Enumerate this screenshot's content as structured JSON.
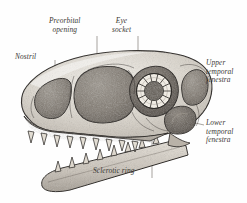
{
  "figure": {
    "style": "stippled engraving",
    "background_color": "#fefefe",
    "ink_color": "#2e2b28",
    "label_color": "#3a3733"
  },
  "labels": {
    "preorbital": "Preorbital\nopening",
    "eye_socket": "Eye\nsocket",
    "nostril": "Nostril",
    "upper_temporal": "Upper\ntemporal\nfenestra",
    "lower_temporal": "Lower\ntemporal\nfenestra",
    "sclerotic_ring": "Sclerotic ring"
  },
  "anatomy": {
    "sclerotic_plate_count": 14,
    "upper_jaw_teeth": 9,
    "lower_jaw_teeth": 8,
    "openings": [
      "nostril",
      "preorbital opening",
      "eye socket",
      "upper temporal fenestra",
      "lower temporal fenestra"
    ]
  }
}
